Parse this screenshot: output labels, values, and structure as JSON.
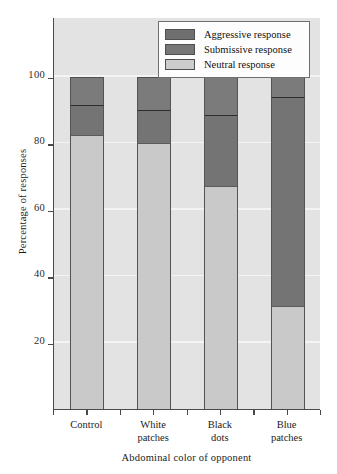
{
  "chart_data": {
    "type": "bar",
    "subtype": "stacked-percentage",
    "title": "",
    "xlabel": "Abdominal color of opponent",
    "ylabel": "Percentage of responses",
    "categories": [
      "Control",
      "White patches",
      "Black dots",
      "Blue patches"
    ],
    "category_lines": [
      [
        "Control"
      ],
      [
        "White",
        "patches"
      ],
      [
        "Black",
        "dots"
      ],
      [
        "Blue",
        "patches"
      ]
    ],
    "series": [
      {
        "name": "Neutral response",
        "values": [
          82.5,
          80,
          67,
          31
        ],
        "color": "#c9c9c9"
      },
      {
        "name": "Submissive response",
        "values": [
          9,
          10,
          21.5,
          63
        ],
        "color": "#747474"
      },
      {
        "name": "Aggressive response",
        "values": [
          8.5,
          10,
          11.5,
          6
        ],
        "color": "#7b7b7b"
      }
    ],
    "stack_tops": {
      "neutral": [
        82.5,
        80,
        67,
        31
      ],
      "neutral_plus_submissive": [
        91.5,
        90,
        88.5,
        94
      ],
      "total": [
        100,
        100,
        100,
        100
      ]
    },
    "ylim": [
      0,
      118
    ],
    "yticks": [
      20,
      40,
      60,
      80,
      100
    ],
    "ytick_labels": [
      "20",
      "40",
      "60",
      "80",
      "100"
    ],
    "grid": "horizontal-white",
    "legend_position": "top-right",
    "legend_entries": [
      "Aggressive response",
      "Submissive response",
      "Neutral response"
    ]
  },
  "axes": {
    "y_title": "Percentage of responses",
    "x_title": "Abdominal color of opponent"
  },
  "legend": {
    "items": [
      {
        "label": "Aggressive response",
        "swatch": "aggressive"
      },
      {
        "label": "Submissive response",
        "swatch": "submissive"
      },
      {
        "label": "Neutral response",
        "swatch": "neutral"
      }
    ]
  },
  "colors": {
    "plot_background": "#e3e3e3",
    "gridline": "#f4f4f4",
    "axis": "#4a4a4a",
    "aggressive": "#7b7b7b",
    "submissive": "#747474",
    "neutral": "#c9c9c9",
    "page_background": "#ffffff"
  }
}
